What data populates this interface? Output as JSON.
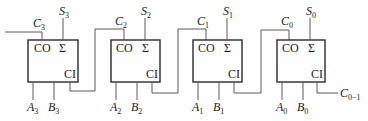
{
  "diagram": {
    "colors": {
      "box_stroke": "#2a2a2a",
      "wire": "#5a5a5a",
      "text": "#1a1a1a"
    },
    "pin_labels": {
      "carry_out": "CO",
      "sum": "Σ",
      "carry_in": "CI"
    },
    "adders": [
      {
        "index": 3,
        "carry_out": {
          "base": "C",
          "sub": "3"
        },
        "sum": {
          "base": "S",
          "sub": "3"
        },
        "a": {
          "base": "A",
          "sub": "3"
        },
        "b": {
          "base": "B",
          "sub": "3"
        }
      },
      {
        "index": 2,
        "carry_out": {
          "base": "C",
          "sub": "2"
        },
        "sum": {
          "base": "S",
          "sub": "2"
        },
        "a": {
          "base": "A",
          "sub": "2"
        },
        "b": {
          "base": "B",
          "sub": "2"
        }
      },
      {
        "index": 1,
        "carry_out": {
          "base": "C",
          "sub": "1"
        },
        "sum": {
          "base": "S",
          "sub": "1"
        },
        "a": {
          "base": "A",
          "sub": "1"
        },
        "b": {
          "base": "B",
          "sub": "1"
        }
      },
      {
        "index": 0,
        "carry_out": {
          "base": "C",
          "sub": "0"
        },
        "sum": {
          "base": "S",
          "sub": "0"
        },
        "a": {
          "base": "A",
          "sub": "0"
        },
        "b": {
          "base": "B",
          "sub": "0"
        }
      }
    ],
    "carry_in": {
      "base": "C",
      "sub": "0−1"
    }
  }
}
